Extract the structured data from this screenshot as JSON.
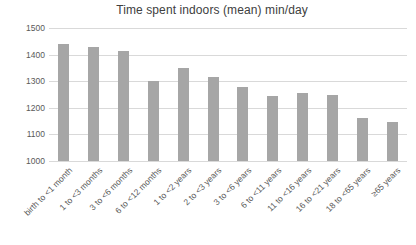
{
  "chart_data": {
    "type": "bar",
    "title": "Time spent indoors (mean) min/day",
    "categories": [
      "birth to <1 month",
      "1 to <3 months",
      "3 to <6 months",
      "6 to <12 months",
      "1 to <2 years",
      "2 to <3 years",
      "3 to <6 years",
      "6 to <11 years",
      "11 to <16 years",
      "16 to <21 years",
      "18 to <65 years",
      "≥65 years"
    ],
    "values": [
      1440,
      1430,
      1415,
      1300,
      1350,
      1315,
      1280,
      1245,
      1255,
      1250,
      1160,
      1145
    ],
    "xlabel": "",
    "ylabel": "",
    "ylim": [
      1000,
      1500
    ],
    "yticks": [
      1000,
      1100,
      1200,
      1300,
      1400,
      1500
    ],
    "grid": true,
    "legend": "none",
    "colors": {
      "bar": "#a6a6a6",
      "gridline": "#d9d9d9",
      "axis_text": "#595959",
      "title_text": "#404040",
      "background": "#ffffff"
    }
  }
}
